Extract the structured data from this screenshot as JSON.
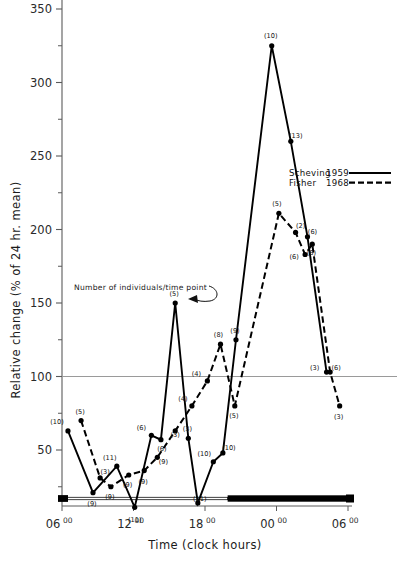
{
  "figure": {
    "axis_color": "#5a5a5a",
    "series_color": "#000000",
    "reference_line_color": "#9a9a9a"
  },
  "chart_data": {
    "type": "line",
    "title": "",
    "xlabel": "Time (clock hours)",
    "ylabel": "Relative change (% of 24 hr. mean)",
    "xlim": [
      6,
      30
    ],
    "ylim": [
      0,
      365
    ],
    "yticks": [
      50,
      100,
      150,
      200,
      250,
      300,
      350
    ],
    "yticks_minor": [
      25,
      75,
      125,
      175,
      225,
      275,
      325
    ],
    "xticks": [
      6,
      12,
      18,
      24,
      30
    ],
    "xtick_labels": [
      "06",
      "12",
      "18",
      "00",
      "06"
    ],
    "xtick_superscript": "00",
    "grid": false,
    "reference_line": {
      "y": 100,
      "label": "100% of 24 hr. mean"
    },
    "legend": {
      "position": "upper-right",
      "entries": [
        {
          "name": "Scheving",
          "year": "1959",
          "style": "solid"
        },
        {
          "name": "Fisher",
          "year": "1968",
          "style": "dashed"
        }
      ]
    },
    "annotation": {
      "text": "Number of individuals/time point",
      "points_to": "(5)",
      "description": "Parenthesised numbers beside each point give sample size"
    },
    "daynight_bar": {
      "light_from": 6,
      "light_to": 19.9,
      "dark_from": 19.9,
      "dark_to": 30,
      "light_color": "#ffffff",
      "dark_color": "#000000"
    },
    "series": [
      {
        "name": "Scheving 1959",
        "style": "solid",
        "points": [
          {
            "x": 6.5,
            "y": 63,
            "n": "(10)"
          },
          {
            "x": 8.6,
            "y": 21,
            "n": "(9)"
          },
          {
            "x": 10.6,
            "y": 39,
            "n": "(11)"
          },
          {
            "x": 12.1,
            "y": 11,
            "n": "(11)"
          },
          {
            "x": 13.5,
            "y": 60,
            "n": "(6)"
          },
          {
            "x": 14.3,
            "y": 57,
            "n": "(6)"
          },
          {
            "x": 15.5,
            "y": 150,
            "n": "(5)"
          },
          {
            "x": 16.6,
            "y": 58,
            "n": "(3)"
          },
          {
            "x": 17.4,
            "y": 14,
            "n": "(11)"
          },
          {
            "x": 18.7,
            "y": 42,
            "n": "(10)"
          },
          {
            "x": 19.5,
            "y": 48,
            "n": "(10)"
          },
          {
            "x": 20.6,
            "y": 125,
            "n": "(9)"
          },
          {
            "x": 23.6,
            "y": 325,
            "n": "(10)"
          },
          {
            "x": 25.2,
            "y": 260,
            "n": "(13)"
          },
          {
            "x": 26.6,
            "y": 195,
            "n": "(6)"
          },
          {
            "x": 28.2,
            "y": 103,
            "n": "(3)"
          }
        ]
      },
      {
        "name": "Fisher 1968",
        "style": "dashed",
        "points": [
          {
            "x": 7.6,
            "y": 70,
            "n": "(5)"
          },
          {
            "x": 9.2,
            "y": 31,
            "n": "(3)"
          },
          {
            "x": 10.1,
            "y": 25,
            "n": "(9)"
          },
          {
            "x": 11.6,
            "y": 33,
            "n": "(9)"
          },
          {
            "x": 12.9,
            "y": 36,
            "n": "(9)"
          },
          {
            "x": 14.0,
            "y": 45,
            "n": "(9)"
          },
          {
            "x": 15.5,
            "y": 63,
            "n": "(3)"
          },
          {
            "x": 16.9,
            "y": 80,
            "n": "(4)"
          },
          {
            "x": 18.2,
            "y": 97,
            "n": "(4)"
          },
          {
            "x": 19.3,
            "y": 122,
            "n": "(8)"
          },
          {
            "x": 20.5,
            "y": 80,
            "n": "(5)"
          },
          {
            "x": 24.2,
            "y": 211,
            "n": "(5)"
          },
          {
            "x": 25.6,
            "y": 198,
            "n": "(2)"
          },
          {
            "x": 26.4,
            "y": 183,
            "n": "(6)"
          },
          {
            "x": 27.0,
            "y": 190,
            "n": "(6)"
          },
          {
            "x": 28.5,
            "y": 103,
            "n": "(6)"
          },
          {
            "x": 29.3,
            "y": 80,
            "n": "(3)"
          }
        ]
      }
    ]
  }
}
